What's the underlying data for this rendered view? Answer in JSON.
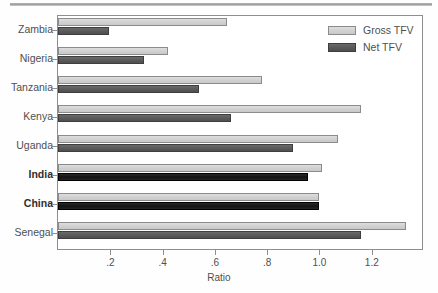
{
  "chart_data": {
    "type": "bar",
    "orientation": "horizontal",
    "title": "",
    "xlabel": "Ratio",
    "ylabel": "",
    "xlim": [
      0,
      1.392
    ],
    "xticks": [
      0.2,
      0.4,
      0.6,
      0.8,
      1.0,
      1.2
    ],
    "xticklabels": [
      ".2",
      ".4",
      ".6",
      ".8",
      "1.0",
      "1.2"
    ],
    "grid": false,
    "legend_position": "top-right",
    "categories": [
      "Zambia",
      "Nigeria",
      "Tanzania",
      "Kenya",
      "Uganda",
      "India",
      "China",
      "Senegal"
    ],
    "emphasized_categories": [
      "India",
      "China"
    ],
    "series": [
      {
        "name": "Gross TFV",
        "color": "#d2d2d2",
        "values": [
          0.645,
          0.42,
          0.78,
          1.16,
          1.07,
          1.01,
          1.0,
          1.33
        ]
      },
      {
        "name": "Net TFV",
        "color": "#595959",
        "highlight_color": "#141414",
        "values": [
          0.195,
          0.33,
          0.54,
          0.66,
          0.9,
          0.955,
          1.0,
          1.16
        ]
      }
    ]
  },
  "legend": {
    "entries": [
      {
        "label": "Gross TFV",
        "swatch": "gross"
      },
      {
        "label": "Net TFV",
        "swatch": "net"
      }
    ]
  },
  "axis": {
    "x_title": "Ratio"
  }
}
